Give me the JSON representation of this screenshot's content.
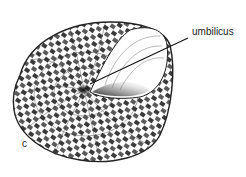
{
  "figure": {
    "panel_label": "c",
    "annotations": [
      {
        "text": "umbilicus",
        "target": "umbilicus"
      }
    ],
    "colors": {
      "ink": "#222222",
      "background": "#ffffff",
      "shade": "#555555"
    }
  }
}
